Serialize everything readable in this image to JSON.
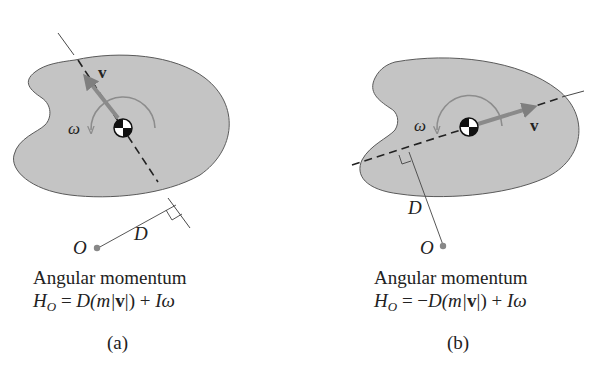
{
  "panels": [
    {
      "id": "a",
      "caption": "(a)",
      "title": "Angular momentum",
      "formula": {
        "lhs": "H",
        "lhs_sub": "O",
        "eq": " = ",
        "sign": "",
        "D": "D",
        "paren_open": "(m|",
        "v": "v",
        "paren_close": "|) + ",
        "I": "Iω"
      },
      "labels": {
        "v": "v",
        "omega": "ω",
        "D": "D",
        "O": "O"
      }
    },
    {
      "id": "b",
      "caption": "(b)",
      "title": "Angular momentum",
      "formula": {
        "lhs": "H",
        "lhs_sub": "O",
        "eq": " = ",
        "sign": "−",
        "D": "D",
        "paren_open": "(m|",
        "v": "v",
        "paren_close": "|) + ",
        "I": "Iω"
      },
      "labels": {
        "v": "v",
        "omega": "ω",
        "D": "D",
        "O": "O"
      }
    }
  ],
  "colors": {
    "body_fill": "#c4c4c4",
    "body_stroke": "#5a5a5a",
    "arrow": "#8a8a8a",
    "line": "#333333",
    "point": "#888888"
  }
}
